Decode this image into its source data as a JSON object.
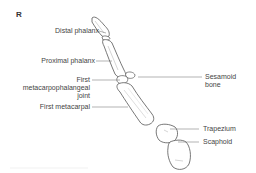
{
  "figure": {
    "panel_letter": "R",
    "labels": {
      "distal_phalanx": "Distal phalanx",
      "proximal_phalanx": "Proximal phalanx",
      "mcp_joint_line1": "First",
      "mcp_joint_line2": "metacarpophalangeal",
      "mcp_joint_line3": "joint",
      "first_metacarpal": "First metacarpal",
      "sesamoid_line1": "Sesamoid",
      "sesamoid_line2": "bone",
      "trapezium": "Trapezium",
      "scaphoid": "Scaphoid"
    },
    "colors": {
      "line": "#555555",
      "text": "#444444",
      "shade": "#bbbbbb"
    }
  }
}
